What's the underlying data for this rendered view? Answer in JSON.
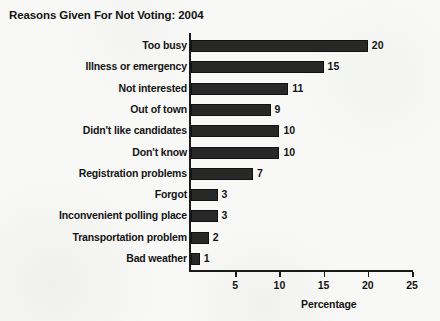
{
  "chart_data": {
    "type": "bar",
    "orientation": "horizontal",
    "title": "Reasons Given For Not Voting: 2004",
    "xlabel": "Percentage",
    "ylabel": "",
    "xlim": [
      0,
      25
    ],
    "grid": false,
    "legend": null,
    "categories": [
      "Too busy",
      "Illness or emergency",
      "Not interested",
      "Out of town",
      "Didn't like candidates",
      "Don't know",
      "Registration problems",
      "Forgot",
      "Inconvenient polling place",
      "Transportation problem",
      "Bad weather"
    ],
    "values": [
      20,
      15,
      11,
      9,
      10,
      10,
      7,
      3,
      3,
      2,
      1
    ],
    "value_labels": [
      "20",
      "15",
      "11",
      "9",
      "10",
      "10",
      "7",
      "3",
      "3",
      "2",
      "1"
    ],
    "xticks": [
      5,
      10,
      15,
      20,
      25
    ],
    "xtick_labels": [
      "5",
      "10",
      "15",
      "20",
      "25"
    ],
    "bar_color": "#282828",
    "background_color": "#f8f8f6",
    "axis_color": "#1a1a1a",
    "text_color": "#141414"
  }
}
